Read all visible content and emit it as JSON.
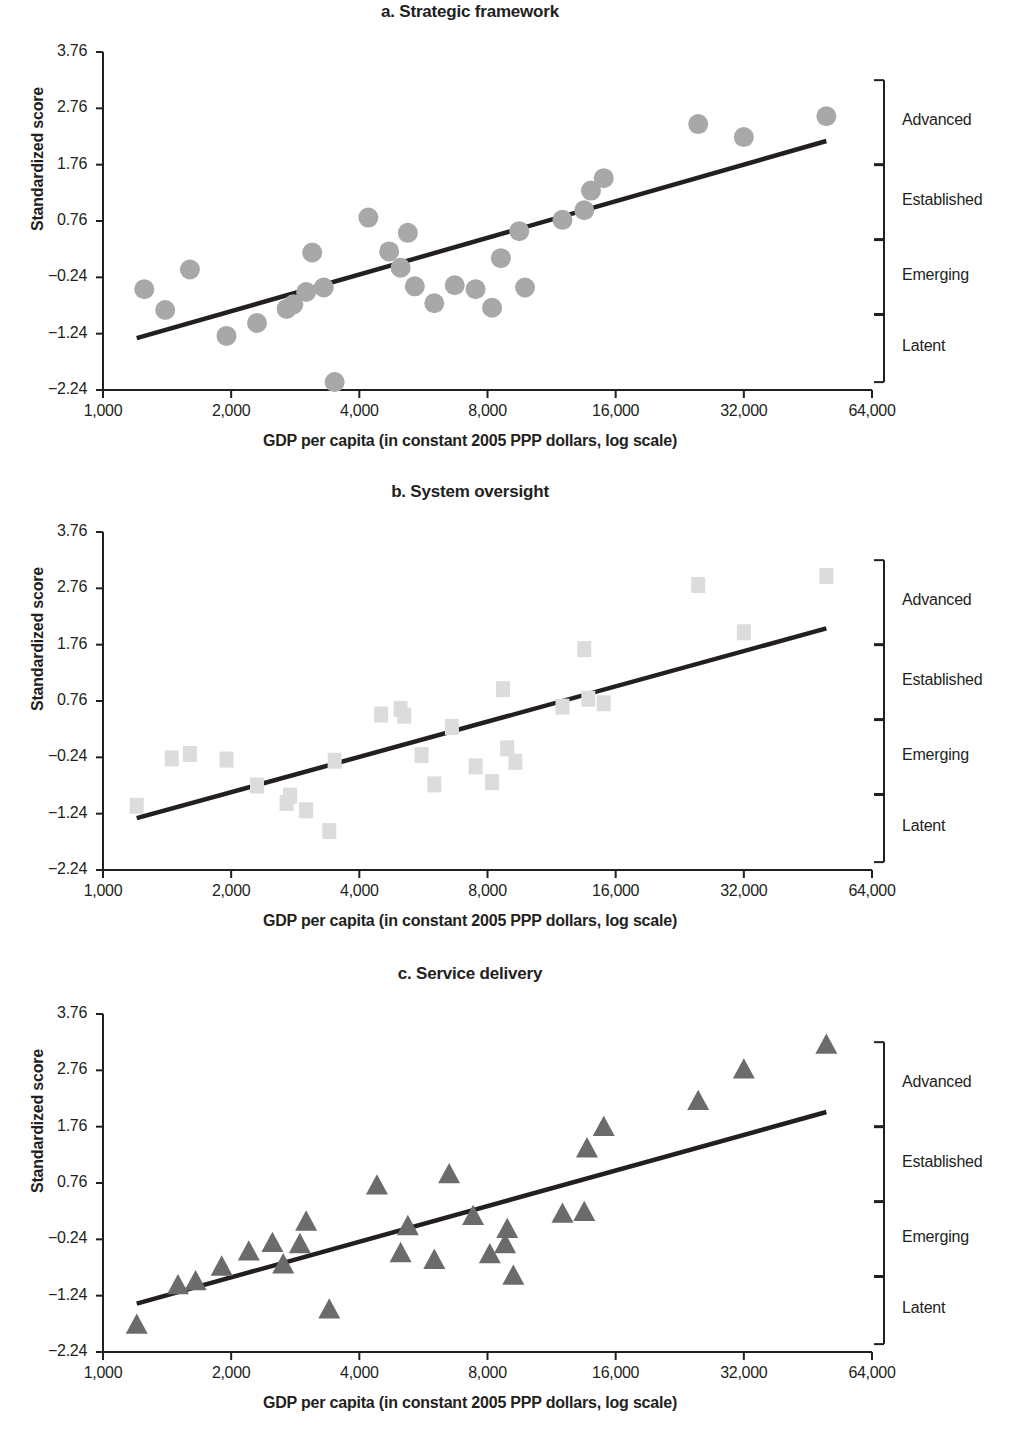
{
  "figure": {
    "panels": [
      {
        "id": "a",
        "title": "a. Strategic framework",
        "marker": "circle",
        "marker_color": "#a8a8a8"
      },
      {
        "id": "b",
        "title": "b. System oversight",
        "marker": "square",
        "marker_color": "#dcdcdc"
      },
      {
        "id": "c",
        "title": "c. Service delivery",
        "marker": "triangle",
        "marker_color": "#6b6b6b"
      }
    ],
    "axis": {
      "ylabel": "Standardized score",
      "xlabel": "GDP per capita (in constant 2005 PPP dollars, log scale)",
      "yticks": [
        "3.76",
        "2.76",
        "1.76",
        "0.76",
        "−0.24",
        "−1.24",
        "−2.24"
      ],
      "ytick_values": [
        3.76,
        2.76,
        1.76,
        0.76,
        -0.24,
        -1.24,
        -2.24
      ],
      "xticks": [
        "1,000",
        "2,000",
        "4,000",
        "8,000",
        "16,000",
        "32,000",
        "64,000"
      ],
      "xtick_values": [
        1000,
        2000,
        4000,
        8000,
        16000,
        32000,
        64000
      ]
    },
    "categories": [
      {
        "label": "Advanced",
        "min": 1.76,
        "max": 3.26
      },
      {
        "label": "Established",
        "min": 0.43,
        "max": 1.76
      },
      {
        "label": "Emerging",
        "min": -0.9,
        "max": 0.43
      },
      {
        "label": "Latent",
        "min": -2.1,
        "max": -0.9
      }
    ]
  },
  "chart_data": [
    {
      "type": "scatter",
      "panel": "a",
      "title": "a. Strategic framework",
      "xlabel": "GDP per capita (in constant 2005 PPP dollars, log scale)",
      "ylabel": "Standardized score",
      "xscale": "log",
      "xlim": [
        1000,
        64000
      ],
      "ylim": [
        -2.24,
        3.76
      ],
      "grid": false,
      "legend": null,
      "marker": "circle",
      "points": [
        {
          "x": 1250,
          "y": -0.45
        },
        {
          "x": 1400,
          "y": -0.82
        },
        {
          "x": 1600,
          "y": -0.1
        },
        {
          "x": 1950,
          "y": -1.28
        },
        {
          "x": 2300,
          "y": -1.05
        },
        {
          "x": 2700,
          "y": -0.8
        },
        {
          "x": 2800,
          "y": -0.72
        },
        {
          "x": 3000,
          "y": -0.5
        },
        {
          "x": 3100,
          "y": 0.2
        },
        {
          "x": 3300,
          "y": -0.42
        },
        {
          "x": 3500,
          "y": -2.1
        },
        {
          "x": 4200,
          "y": 0.82
        },
        {
          "x": 4700,
          "y": 0.22
        },
        {
          "x": 5000,
          "y": -0.07
        },
        {
          "x": 5200,
          "y": 0.55
        },
        {
          "x": 5400,
          "y": -0.4
        },
        {
          "x": 6000,
          "y": -0.7
        },
        {
          "x": 6700,
          "y": -0.38
        },
        {
          "x": 7500,
          "y": -0.45
        },
        {
          "x": 8200,
          "y": -0.78
        },
        {
          "x": 8600,
          "y": 0.1
        },
        {
          "x": 9500,
          "y": 0.58
        },
        {
          "x": 9800,
          "y": -0.42
        },
        {
          "x": 12000,
          "y": 0.78
        },
        {
          "x": 13500,
          "y": 0.95
        },
        {
          "x": 14000,
          "y": 1.3
        },
        {
          "x": 15000,
          "y": 1.52
        },
        {
          "x": 25000,
          "y": 2.48
        },
        {
          "x": 32000,
          "y": 2.25
        },
        {
          "x": 50000,
          "y": 2.62
        }
      ],
      "trendline": {
        "x0": 1200,
        "y0": -1.32,
        "x1": 50000,
        "y1": 2.18
      }
    },
    {
      "type": "scatter",
      "panel": "b",
      "title": "b. System oversight",
      "xlabel": "GDP per capita (in constant 2005 PPP dollars, log scale)",
      "ylabel": "Standardized score",
      "xscale": "log",
      "xlim": [
        1000,
        64000
      ],
      "ylim": [
        -2.24,
        3.76
      ],
      "grid": false,
      "legend": null,
      "marker": "square",
      "points": [
        {
          "x": 1200,
          "y": -1.1
        },
        {
          "x": 1450,
          "y": -0.26
        },
        {
          "x": 1600,
          "y": -0.18
        },
        {
          "x": 1950,
          "y": -0.28
        },
        {
          "x": 2300,
          "y": -0.74
        },
        {
          "x": 2700,
          "y": -1.05
        },
        {
          "x": 2750,
          "y": -0.92
        },
        {
          "x": 3000,
          "y": -1.18
        },
        {
          "x": 3400,
          "y": -1.55
        },
        {
          "x": 3500,
          "y": -0.3
        },
        {
          "x": 4500,
          "y": 0.52
        },
        {
          "x": 5000,
          "y": 0.62
        },
        {
          "x": 5100,
          "y": 0.5
        },
        {
          "x": 5600,
          "y": -0.2
        },
        {
          "x": 6000,
          "y": -0.72
        },
        {
          "x": 6600,
          "y": 0.3
        },
        {
          "x": 7500,
          "y": -0.4
        },
        {
          "x": 8200,
          "y": -0.68
        },
        {
          "x": 8700,
          "y": 0.97
        },
        {
          "x": 8900,
          "y": -0.08
        },
        {
          "x": 9300,
          "y": -0.32
        },
        {
          "x": 12000,
          "y": 0.66
        },
        {
          "x": 13500,
          "y": 1.68
        },
        {
          "x": 13800,
          "y": 0.8
        },
        {
          "x": 15000,
          "y": 0.72
        },
        {
          "x": 25000,
          "y": 2.82
        },
        {
          "x": 32000,
          "y": 1.98
        },
        {
          "x": 50000,
          "y": 2.98
        }
      ],
      "trendline": {
        "x0": 1200,
        "y0": -1.32,
        "x1": 50000,
        "y1": 2.05
      }
    },
    {
      "type": "scatter",
      "panel": "c",
      "title": "c. Service delivery",
      "xlabel": "GDP per capita (in constant 2005 PPP dollars, log scale)",
      "ylabel": "Standardized score",
      "xscale": "log",
      "xlim": [
        1000,
        64000
      ],
      "ylim": [
        -2.24,
        3.76
      ],
      "grid": false,
      "legend": null,
      "marker": "triangle",
      "points": [
        {
          "x": 1200,
          "y": -1.75
        },
        {
          "x": 1500,
          "y": -1.05
        },
        {
          "x": 1650,
          "y": -0.98
        },
        {
          "x": 1900,
          "y": -0.72
        },
        {
          "x": 2200,
          "y": -0.45
        },
        {
          "x": 2500,
          "y": -0.3
        },
        {
          "x": 2650,
          "y": -0.68
        },
        {
          "x": 2900,
          "y": -0.32
        },
        {
          "x": 3000,
          "y": 0.08
        },
        {
          "x": 3400,
          "y": -1.48
        },
        {
          "x": 4400,
          "y": 0.72
        },
        {
          "x": 5000,
          "y": -0.48
        },
        {
          "x": 5200,
          "y": 0.0
        },
        {
          "x": 6000,
          "y": -0.6
        },
        {
          "x": 6500,
          "y": 0.92
        },
        {
          "x": 7400,
          "y": 0.18
        },
        {
          "x": 8100,
          "y": -0.5
        },
        {
          "x": 8800,
          "y": -0.32
        },
        {
          "x": 8900,
          "y": -0.05
        },
        {
          "x": 9200,
          "y": -0.88
        },
        {
          "x": 12000,
          "y": 0.22
        },
        {
          "x": 13500,
          "y": 0.25
        },
        {
          "x": 13700,
          "y": 1.38
        },
        {
          "x": 15000,
          "y": 1.76
        },
        {
          "x": 25000,
          "y": 2.22
        },
        {
          "x": 32000,
          "y": 2.78
        },
        {
          "x": 50000,
          "y": 3.22
        }
      ],
      "trendline": {
        "x0": 1200,
        "y0": -1.38,
        "x1": 50000,
        "y1": 2.02
      }
    }
  ]
}
